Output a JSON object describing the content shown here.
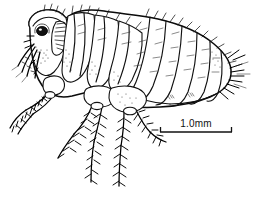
{
  "figure": {
    "kind": "scientific-line-drawing",
    "view": "lateral",
    "style": "black ink line art on white",
    "background_color": "#ffffff",
    "ink_color": "#000000"
  },
  "scale_bar": {
    "label": "1.0mm",
    "bar_length_px": 72,
    "tick_style": "end-caps-down",
    "position": "lower-right"
  },
  "anatomy": {
    "parts": [
      {
        "name": "head",
        "label": "head"
      },
      {
        "name": "eye",
        "label": "eye"
      },
      {
        "name": "antenna",
        "label": "antenna"
      },
      {
        "name": "maxillary-palp",
        "label": "maxillary palp"
      },
      {
        "name": "mouthparts",
        "label": "mouthparts"
      },
      {
        "name": "pronotum",
        "label": "pronotum"
      },
      {
        "name": "mesothorax",
        "label": "mesothorax"
      },
      {
        "name": "metathorax",
        "label": "metathorax"
      },
      {
        "name": "abdomen",
        "label": "abdomen"
      },
      {
        "name": "foreleg",
        "label": "foreleg"
      },
      {
        "name": "midleg",
        "label": "midleg"
      },
      {
        "name": "hindleg",
        "label": "hindleg"
      },
      {
        "name": "setae",
        "label": "setae"
      }
    ],
    "abdominal_segment_count": 7
  }
}
